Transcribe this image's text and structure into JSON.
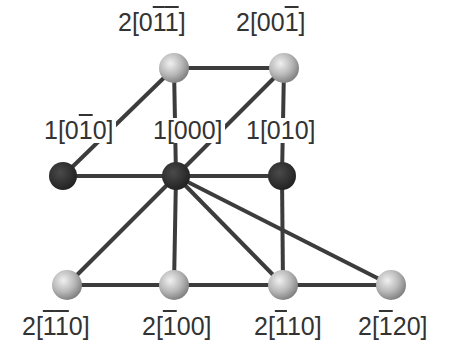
{
  "diagram": {
    "title": "",
    "colors": {
      "edge": "#3c3c3c",
      "node_grey_light": "#e0e0e0",
      "node_grey_dark": "#8a8a8a",
      "node_black": "#2a2a2a",
      "label": "#333333"
    },
    "nodes": [
      {
        "id": "n_0m1m1",
        "label_prefix": "2[",
        "digits": [
          {
            "d": "0",
            "bar": false
          },
          {
            "d": "1",
            "bar": true
          },
          {
            "d": "1",
            "bar": true
          }
        ],
        "label_suffix": "]",
        "kind": "grey",
        "x": 174,
        "y": 68,
        "lx": 116,
        "ly": 10
      },
      {
        "id": "n_00m1",
        "label_prefix": "2[",
        "digits": [
          {
            "d": "0",
            "bar": false
          },
          {
            "d": "0",
            "bar": false
          },
          {
            "d": "1",
            "bar": true
          }
        ],
        "label_suffix": "]",
        "kind": "grey",
        "x": 284,
        "y": 68,
        "lx": 234,
        "ly": 10
      },
      {
        "id": "n_0m10",
        "label_prefix": "1[",
        "digits": [
          {
            "d": "0",
            "bar": false
          },
          {
            "d": "1",
            "bar": true
          },
          {
            "d": "0",
            "bar": false
          }
        ],
        "label_suffix": "]",
        "kind": "black",
        "x": 63,
        "y": 176,
        "lx": 42,
        "ly": 118
      },
      {
        "id": "n_000",
        "label_prefix": "1[",
        "digits": [
          {
            "d": "0",
            "bar": false
          },
          {
            "d": "0",
            "bar": false
          },
          {
            "d": "0",
            "bar": false
          }
        ],
        "label_suffix": "]",
        "kind": "black",
        "x": 176,
        "y": 176,
        "lx": 151,
        "ly": 118
      },
      {
        "id": "n_010",
        "label_prefix": "1[",
        "digits": [
          {
            "d": "0",
            "bar": false
          },
          {
            "d": "1",
            "bar": false
          },
          {
            "d": "0",
            "bar": false
          }
        ],
        "label_suffix": "]",
        "kind": "black",
        "x": 282,
        "y": 176,
        "lx": 244,
        "ly": 118
      },
      {
        "id": "n_m1m10",
        "label_prefix": "2[",
        "digits": [
          {
            "d": "1",
            "bar": true
          },
          {
            "d": "1",
            "bar": true
          },
          {
            "d": "0",
            "bar": false
          }
        ],
        "label_suffix": "]",
        "kind": "grey",
        "x": 67,
        "y": 285,
        "lx": 20,
        "ly": 314
      },
      {
        "id": "n_m100",
        "label_prefix": "2[",
        "digits": [
          {
            "d": "1",
            "bar": true
          },
          {
            "d": "0",
            "bar": false
          },
          {
            "d": "0",
            "bar": false
          }
        ],
        "label_suffix": "]",
        "kind": "grey",
        "x": 174,
        "y": 285,
        "lx": 140,
        "ly": 314
      },
      {
        "id": "n_m110",
        "label_prefix": "2[",
        "digits": [
          {
            "d": "1",
            "bar": true
          },
          {
            "d": "1",
            "bar": false
          },
          {
            "d": "0",
            "bar": false
          }
        ],
        "label_suffix": "]",
        "kind": "grey",
        "x": 283,
        "y": 285,
        "lx": 252,
        "ly": 314
      },
      {
        "id": "n_m120",
        "label_prefix": "2[",
        "digits": [
          {
            "d": "1",
            "bar": true
          },
          {
            "d": "2",
            "bar": false
          },
          {
            "d": "0",
            "bar": false
          }
        ],
        "label_suffix": "]",
        "kind": "grey",
        "x": 391,
        "y": 285,
        "lx": 356,
        "ly": 314
      }
    ],
    "edges": [
      [
        "n_0m1m1",
        "n_00m1"
      ],
      [
        "n_0m1m1",
        "n_0m10"
      ],
      [
        "n_0m1m1",
        "n_000"
      ],
      [
        "n_00m1",
        "n_000"
      ],
      [
        "n_00m1",
        "n_010"
      ],
      [
        "n_0m10",
        "n_000"
      ],
      [
        "n_000",
        "n_010"
      ],
      [
        "n_000",
        "n_m1m10"
      ],
      [
        "n_000",
        "n_m100"
      ],
      [
        "n_000",
        "n_m110"
      ],
      [
        "n_000",
        "n_m120"
      ],
      [
        "n_010",
        "n_m110"
      ],
      [
        "n_m1m10",
        "n_m100"
      ],
      [
        "n_m100",
        "n_m110"
      ],
      [
        "n_m110",
        "n_m120"
      ]
    ],
    "labels_text": [
      "2[0̅1̅1]",
      "2[001̅]",
      "1[01̅0]",
      "1[000]",
      "1[010]",
      "2[1̅1̅0]",
      "2[1̅00]",
      "2[1̅10]",
      "2[1̅20]"
    ]
  }
}
